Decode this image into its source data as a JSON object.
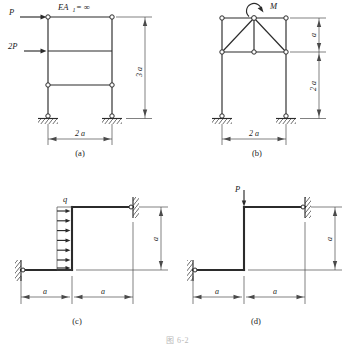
{
  "figure": {
    "background": "#ffffff",
    "line_color": "#2b2b2b",
    "dimension_color": "#4a4a4a",
    "bottom_caption": "图 6-2"
  },
  "panels": [
    {
      "id": "a",
      "caption": "(a)",
      "type": "two-bay-portal-frame",
      "top_label": "EA",
      "top_label_sub": "1",
      "top_label_eq": "= ∞",
      "loads": [
        {
          "name": "P",
          "label": "P",
          "direction": "right",
          "at": "top-left-joint"
        },
        {
          "name": "2P",
          "label": "2P",
          "direction": "right",
          "at": "mid-left-joint"
        }
      ],
      "dimensions": [
        {
          "label": "3 a",
          "orientation": "vertical",
          "side": "right"
        },
        {
          "label": "2 a",
          "orientation": "horizontal",
          "side": "bottom"
        }
      ],
      "supports": [
        "pinned",
        "pinned"
      ]
    },
    {
      "id": "b",
      "caption": "(b)",
      "type": "truss-on-columns",
      "loads": [
        {
          "name": "M",
          "label": "M",
          "direction": "moment-ccw",
          "at": "top-apex"
        }
      ],
      "dimensions": [
        {
          "label": "a",
          "orientation": "vertical",
          "side": "right"
        },
        {
          "label": "2 a",
          "orientation": "vertical",
          "side": "right"
        },
        {
          "label": "2 a",
          "orientation": "horizontal",
          "side": "bottom"
        }
      ],
      "supports": [
        "pinned",
        "pinned"
      ]
    },
    {
      "id": "c",
      "caption": "(c)",
      "type": "z-frame-distributed-load",
      "loads": [
        {
          "name": "q",
          "label": "q",
          "direction": "right-distributed",
          "arrow_count": 7,
          "at": "vertical-member"
        }
      ],
      "dimensions": [
        {
          "label": "a",
          "orientation": "vertical",
          "side": "right"
        },
        {
          "label": "a",
          "orientation": "horizontal",
          "side": "bottom-left"
        },
        {
          "label": "a",
          "orientation": "horizontal",
          "side": "bottom-right"
        }
      ],
      "supports": [
        "fixed-wall-left",
        "fixed-wall-right"
      ]
    },
    {
      "id": "d",
      "caption": "(d)",
      "type": "z-frame-point-load",
      "loads": [
        {
          "name": "P",
          "label": "P",
          "direction": "down",
          "at": "top-of-vertical-member"
        }
      ],
      "dimensions": [
        {
          "label": "a",
          "orientation": "vertical",
          "side": "right"
        },
        {
          "label": "a",
          "orientation": "horizontal",
          "side": "bottom-left"
        },
        {
          "label": "a",
          "orientation": "horizontal",
          "side": "bottom-right"
        }
      ],
      "supports": [
        "fixed-wall-left",
        "fixed-wall-right"
      ]
    }
  ]
}
